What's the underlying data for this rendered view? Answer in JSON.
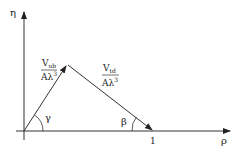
{
  "diagram": {
    "axes": {
      "y_label": "η",
      "x_label": "ρ",
      "tick_one": "1"
    },
    "sides": {
      "left": {
        "num": "V",
        "num_sub": "ub",
        "den": "Aλ",
        "den_sup": "3"
      },
      "right": {
        "num": "V",
        "num_sub": "td",
        "den": "Aλ",
        "den_sup": "3"
      }
    },
    "angles": {
      "origin": "γ",
      "one": "β"
    },
    "colors": {
      "line": "#333333",
      "background": "#ffffff"
    }
  }
}
